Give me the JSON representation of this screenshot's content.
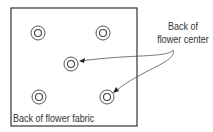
{
  "diagram": {
    "callout_label": {
      "line1": "Back of",
      "line2": "flower center"
    },
    "fabric_label": "Back of flower fabric",
    "colors": {
      "stroke": "#333333",
      "background": "#ffffff"
    },
    "flower_centers": [
      {
        "x": 38,
        "y": 33
      },
      {
        "x": 103,
        "y": 33
      },
      {
        "x": 71,
        "y": 64
      },
      {
        "x": 39,
        "y": 97
      },
      {
        "x": 107,
        "y": 97
      }
    ]
  }
}
